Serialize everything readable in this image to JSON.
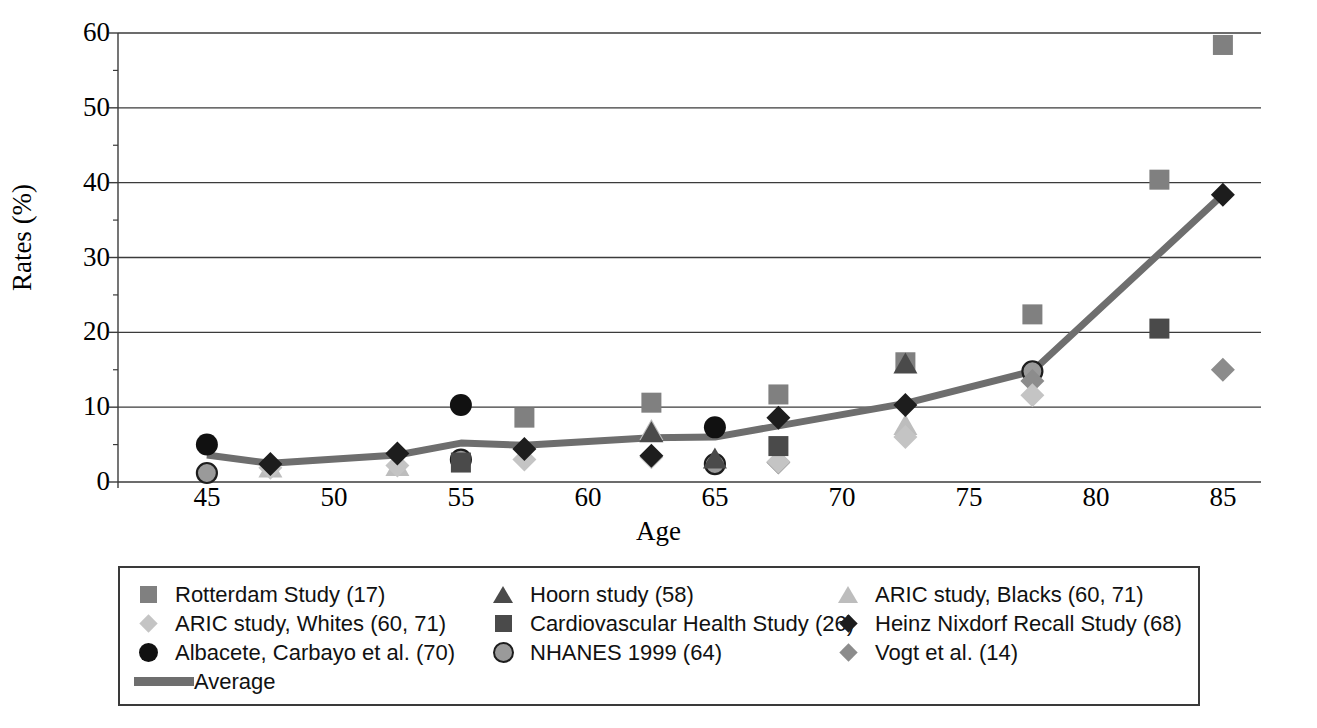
{
  "chart_data": {
    "type": "scatter",
    "title": "",
    "xlabel": "Age",
    "ylabel": "Rates (%)",
    "xlim": [
      41.5,
      86.5
    ],
    "ylim": [
      0,
      60
    ],
    "xticks": [
      45,
      50,
      55,
      60,
      65,
      70,
      75,
      80,
      85
    ],
    "yticks": [
      0,
      10,
      20,
      30,
      40,
      50,
      60
    ],
    "grid": "horizontal",
    "legend_position": "below",
    "series": [
      {
        "name": "Rotterdam Study (17)",
        "marker": "square",
        "color": "#808080",
        "points": [
          [
            57.5,
            8.6
          ],
          [
            62.5,
            10.6
          ],
          [
            67.5,
            11.7
          ],
          [
            72.5,
            16.0
          ],
          [
            77.5,
            22.4
          ],
          [
            82.5,
            40.4
          ],
          [
            85.0,
            58.4
          ]
        ]
      },
      {
        "name": "ARIC study, Whites (60, 71)",
        "marker": "diamond",
        "color": "#c4c4c4",
        "points": [
          [
            47.5,
            1.9
          ],
          [
            52.5,
            2.2
          ],
          [
            57.5,
            3.0
          ],
          [
            62.5,
            3.3
          ],
          [
            67.5,
            2.7
          ],
          [
            72.5,
            6.0
          ],
          [
            77.5,
            11.6
          ]
        ]
      },
      {
        "name": "Albacete, Carbayo et al. (70)",
        "marker": "circle",
        "color": "#111111",
        "points": [
          [
            45.0,
            5.0
          ],
          [
            55.0,
            10.3
          ],
          [
            65.0,
            7.3
          ]
        ]
      },
      {
        "name": "Hoorn study (58)",
        "marker": "triangle",
        "color": "#4a4a4a",
        "points": [
          [
            62.5,
            6.5
          ],
          [
            65.0,
            3.0
          ],
          [
            72.5,
            15.7
          ]
        ]
      },
      {
        "name": "Cardiovascular Health Study (26)",
        "marker": "square",
        "color": "#4a4a4a",
        "points": [
          [
            55.0,
            2.6
          ],
          [
            67.5,
            4.8
          ],
          [
            82.5,
            20.5
          ]
        ]
      },
      {
        "name": "NHANES 1999 (64)",
        "marker": "circle-outline",
        "color": "#9a9a9a",
        "points": [
          [
            45.0,
            1.2
          ],
          [
            55.0,
            3.0
          ],
          [
            65.0,
            2.4
          ],
          [
            77.5,
            14.8
          ]
        ]
      },
      {
        "name": "ARIC study, Blacks (60, 71)",
        "marker": "triangle",
        "color": "#bdbdbd",
        "points": [
          [
            47.5,
            1.8
          ],
          [
            52.5,
            2.0
          ],
          [
            62.5,
            6.8
          ],
          [
            72.5,
            7.5
          ]
        ]
      },
      {
        "name": "Heinz Nixdorf Recall Study (68)",
        "marker": "diamond",
        "color": "#1d1d1d",
        "points": [
          [
            47.5,
            2.4
          ],
          [
            52.5,
            3.8
          ],
          [
            57.5,
            4.4
          ],
          [
            62.5,
            3.5
          ],
          [
            67.5,
            8.6
          ],
          [
            72.5,
            10.3
          ],
          [
            85.0,
            38.4
          ]
        ]
      },
      {
        "name": "Vogt et al. (14)",
        "marker": "diamond",
        "color": "#8c8c8c",
        "points": [
          [
            67.5,
            2.6
          ],
          [
            77.5,
            13.5
          ],
          [
            85.0,
            15.0
          ]
        ]
      }
    ],
    "average_line": {
      "name": "Average",
      "color": "#6e6e6e",
      "width": 7,
      "points": [
        [
          45.0,
          3.6
        ],
        [
          47.5,
          2.5
        ],
        [
          52.5,
          3.6
        ],
        [
          55.0,
          5.2
        ],
        [
          57.5,
          4.9
        ],
        [
          62.5,
          5.9
        ],
        [
          65.0,
          6.0
        ],
        [
          67.5,
          7.5
        ],
        [
          72.5,
          10.5
        ],
        [
          77.5,
          14.8
        ],
        [
          85.0,
          38.4
        ]
      ]
    }
  },
  "axes": {
    "y_title": "Rates (%)",
    "x_title": "Age",
    "y_tick_labels": [
      "60",
      "50",
      "40",
      "30",
      "20",
      "10",
      "0"
    ],
    "x_tick_labels": [
      "45",
      "50",
      "55",
      "60",
      "65",
      "70",
      "75",
      "80",
      "85"
    ]
  },
  "legend": {
    "entries": [
      {
        "label": "Rotterdam Study (17)",
        "marker": "square",
        "color": "#808080"
      },
      {
        "label": "Hoorn study (58)",
        "marker": "triangle",
        "color": "#4a4a4a"
      },
      {
        "label": "ARIC study, Blacks (60, 71)",
        "marker": "triangle",
        "color": "#bdbdbd"
      },
      {
        "label": "ARIC study, Whites (60, 71)",
        "marker": "diamond",
        "color": "#c4c4c4"
      },
      {
        "label": "Cardiovascular Health Study (26)",
        "marker": "square",
        "color": "#4a4a4a"
      },
      {
        "label": "Heinz Nixdorf Recall Study (68)",
        "marker": "diamond",
        "color": "#1d1d1d"
      },
      {
        "label": "Albacete, Carbayo et al. (70)",
        "marker": "circle",
        "color": "#111111"
      },
      {
        "label": "NHANES 1999 (64)",
        "marker": "circle-outline",
        "color": "#9a9a9a"
      },
      {
        "label": "Vogt et al. (14)",
        "marker": "diamond",
        "color": "#8c8c8c"
      },
      {
        "label": "Average",
        "marker": "line",
        "color": "#6e6e6e"
      }
    ]
  }
}
